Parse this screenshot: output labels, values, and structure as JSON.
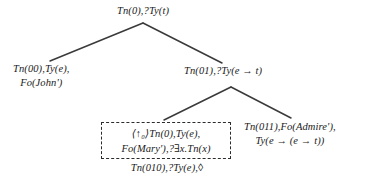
{
  "diagram": {
    "type": "semantic-derivation-tree",
    "title": "",
    "nodes": {
      "root": {
        "id": "root",
        "line1": "Tn(0),?Ty(t)",
        "line2": ""
      },
      "left": {
        "id": "left",
        "line1": "Tn(00),Ty(e),",
        "line2": "Fo(John')"
      },
      "right": {
        "id": "right",
        "line1": "Tn(01),?Ty(e → t)",
        "line2": ""
      },
      "boxed": {
        "id": "boxed",
        "line1": "⟨↑₀⟩Tn(0),Ty(e),",
        "line2": "Fo(Mary'),?∃x.Tn(x)",
        "caption": "Tn(010),?Ty(e),◊",
        "boxed": "true"
      },
      "right_lower": {
        "id": "right_lower",
        "line1": "Tn(011),Fo(Admire'),",
        "line2": "Ty(e → (e → t))"
      }
    },
    "edges": [
      {
        "from": "root",
        "to": "left"
      },
      {
        "from": "root",
        "to": "right"
      },
      {
        "from": "right",
        "to": "boxed"
      },
      {
        "from": "right",
        "to": "right_lower"
      }
    ],
    "colors": {
      "text": "#1a1a1a",
      "edge": "#3a3a3a",
      "box_border": "#2b2b2b",
      "background": "#ffffff"
    }
  }
}
